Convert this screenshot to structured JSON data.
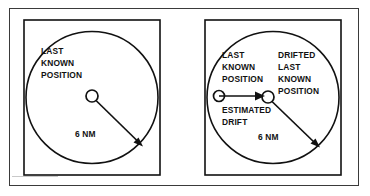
{
  "figure": {
    "panels": [
      {
        "id": "left",
        "name": "last-known-position-panel",
        "labels": {
          "position_line1": "LAST",
          "position_line2": "KNOWN",
          "position_line3": "POSITION",
          "radius": "6 NM"
        },
        "markers": [
          {
            "name": "last-known-position-marker",
            "label": "LAST KNOWN POSITION"
          }
        ],
        "arrows": [
          {
            "name": "radius-arrow",
            "label": "6 NM"
          }
        ]
      },
      {
        "id": "right",
        "name": "drifted-last-known-position-panel",
        "labels": {
          "position_line1": "LAST",
          "position_line2": "KNOWN",
          "position_line3": "POSITION",
          "drifted_line1": "DRIFTED",
          "drifted_line2": "LAST",
          "drifted_line3": "KNOWN",
          "drifted_line4": "POSITION",
          "drift_line1": "ESTIMATED",
          "drift_line2": "DRIFT",
          "radius": "6 NM"
        },
        "markers": [
          {
            "name": "last-known-position-marker",
            "label": "LAST KNOWN POSITION"
          },
          {
            "name": "drifted-last-known-position-marker",
            "label": "DRIFTED LAST KNOWN POSITION"
          }
        ],
        "arrows": [
          {
            "name": "estimated-drift-arrow",
            "label": "ESTIMATED DRIFT"
          },
          {
            "name": "radius-arrow",
            "label": "6 NM"
          }
        ]
      }
    ]
  },
  "colors": {
    "ink": "#111111",
    "frame": "#3a3a3a",
    "paper": "#ffffff",
    "faint_rule": "#c9c9c9"
  }
}
